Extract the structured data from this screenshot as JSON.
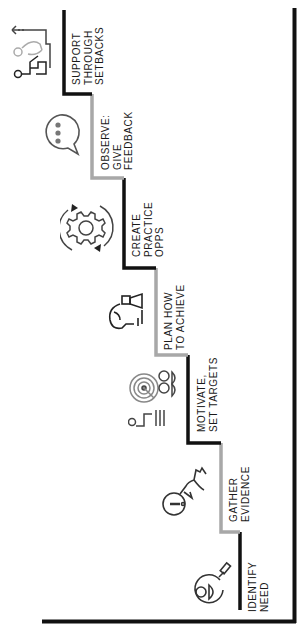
{
  "diagram": {
    "type": "staircase",
    "orientation": "rotated-90",
    "colors": {
      "dark": "#111111",
      "light": "#a8a8a8",
      "icon": "#333333",
      "text": "#1a1a1a"
    },
    "steps": [
      {
        "id": "identify",
        "lines": [
          "IDENTIFY",
          "NEED"
        ],
        "icon": "person-magnifier-icon",
        "segment_color": "dark"
      },
      {
        "id": "gather",
        "lines": [
          "GATHER",
          "EVIDENCE"
        ],
        "icon": "hand-magnifier-icon",
        "segment_color": "light"
      },
      {
        "id": "motivate",
        "lines": [
          "MOTIVATE,",
          "SET TARGETS"
        ],
        "icon": "target-presentation-icon",
        "segment_color": "dark"
      },
      {
        "id": "plan",
        "lines": [
          "PLAN HOW",
          "TO ACHIEVE"
        ],
        "icon": "hand-chess-piece-icon",
        "segment_color": "light"
      },
      {
        "id": "practice",
        "lines": [
          "CREATE",
          "PRACTICE",
          "OPPS"
        ],
        "icon": "gear-cycle-icon",
        "segment_color": "dark"
      },
      {
        "id": "observe",
        "lines": [
          "OBSERVE:",
          "GIVE",
          "FEEDBACK"
        ],
        "icon": "speech-bubble-icon",
        "segment_color": "light"
      },
      {
        "id": "support",
        "lines": [
          "SUPPORT",
          "THROUGH",
          "SETBACKS"
        ],
        "icon": "person-helping-fallen-icon",
        "segment_color": "dark"
      }
    ]
  }
}
